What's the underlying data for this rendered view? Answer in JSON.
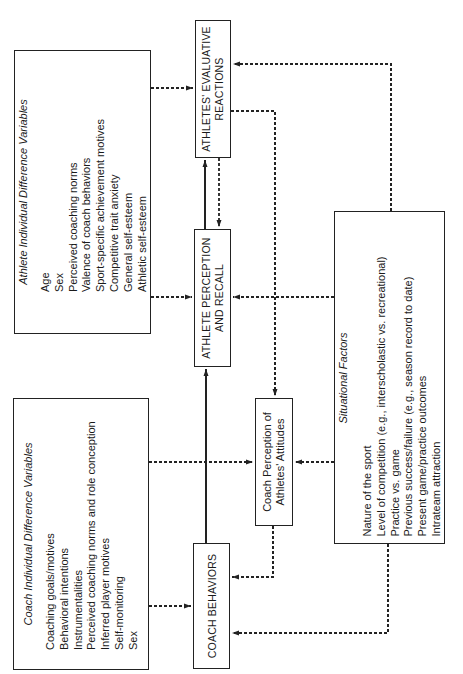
{
  "boxes": {
    "athlete_vars": {
      "title": "Athlete Individual Difference Variables",
      "items": [
        "Age",
        "Sex",
        "Perceived coaching norms",
        "Valence of coach behaviors",
        "Sport-specific achievement motives",
        "Competitive trait anxiety",
        "General self-esteem",
        "Athletic self-esteem"
      ]
    },
    "coach_vars": {
      "title": "Coach Individual Difference Variables",
      "items": [
        "Coaching goals/motives",
        "Behavioral intentions",
        "Instrumentalities",
        "Perceived coaching norms and role conception",
        "Inferred player motives",
        "Self-monitoring",
        "Sex"
      ]
    },
    "situational": {
      "title": "Situational Factors",
      "items": [
        "Nature of the sport",
        "Level of competition (e.g., interscholastic vs. recreational)",
        "Practice vs. game",
        "Previous success/failure (e.g., season record to date)",
        "Present game/practice outcomes",
        "Intrateam attraction"
      ]
    },
    "evaluative": {
      "line1": "ATHLETES' EVALUATIVE",
      "line2": "REACTIONS"
    },
    "perception": {
      "line1": "ATHLETE PERCEPTION",
      "line2": "AND RECALL"
    },
    "coach_behaviors": {
      "line1": "COACH BEHAVIORS"
    },
    "coach_perception": {
      "line1": "Coach Perception of",
      "line2": "Athletes' Attitudes"
    }
  },
  "colors": {
    "line": "#222222",
    "background": "#ffffff"
  }
}
